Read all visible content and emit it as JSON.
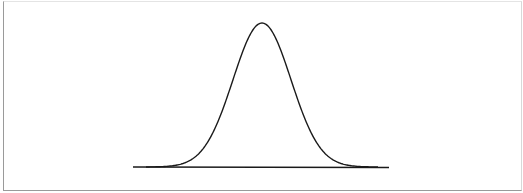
{
  "figure": {
    "stroke_color": "#1a1a1a",
    "frame_color": "#9a9a9a"
  },
  "curve": {
    "type": "gaussian",
    "peak_x": 262,
    "peak_y": 23,
    "baseline_y": 167,
    "sigma_px": 29,
    "baseline_start_x": 133,
    "baseline_end_x": 389
  }
}
